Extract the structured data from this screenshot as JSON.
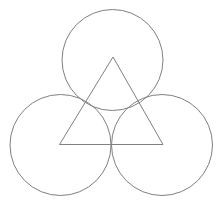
{
  "diagram": {
    "canvas": {
      "width": 222,
      "height": 202
    },
    "stroke_color": "#808080",
    "background": "#ffffff",
    "circles": [
      {
        "id": "top",
        "cx": 112.5,
        "cy": 60,
        "r": 50.5
      },
      {
        "id": "bottom-left",
        "cx": 60.5,
        "cy": 145,
        "r": 50.5
      },
      {
        "id": "bottom-right",
        "cx": 162,
        "cy": 145,
        "r": 50.5
      }
    ],
    "triangle": {
      "points": [
        [
          113,
          57
        ],
        [
          59.5,
          144.5
        ],
        [
          163,
          144.5
        ]
      ]
    }
  }
}
